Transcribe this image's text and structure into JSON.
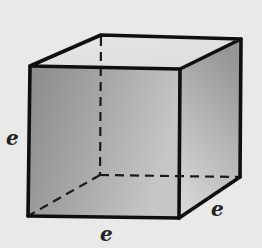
{
  "diagram": {
    "type": "cube",
    "labels": {
      "left_edge": "e",
      "bottom_edge": "e",
      "depth_edge": "e"
    },
    "vertices": {
      "front_top_left": [
        30,
        66
      ],
      "front_top_right": [
        180,
        69
      ],
      "front_bottom_left": [
        28,
        216
      ],
      "front_bottom_right": [
        179,
        218
      ],
      "back_top_left": [
        101,
        35
      ],
      "back_top_right": [
        241,
        39
      ],
      "back_bottom_left": [
        100,
        175
      ],
      "back_bottom_right": [
        240,
        177
      ]
    },
    "colors": {
      "background": "#e9e9e7",
      "edge": "#111111",
      "top_face": "#e2e2e0",
      "front_face_dark": "#8e8e8e",
      "front_face_light": "#c4c4c2",
      "right_face_dark": "#9a9a9a",
      "right_face_light": "#d4d4d2"
    }
  }
}
